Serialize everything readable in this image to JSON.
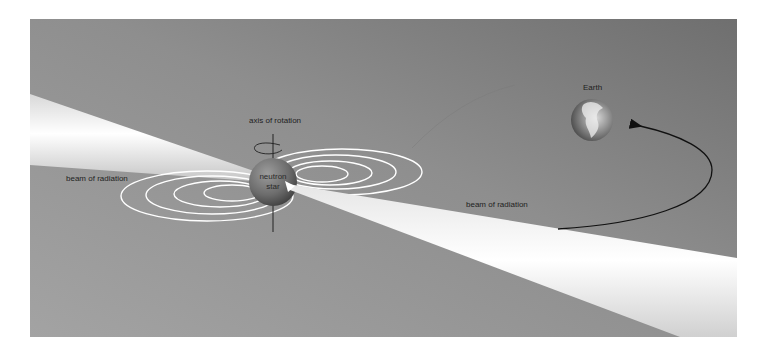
{
  "diagram": {
    "labels": {
      "axis": "axis of rotation",
      "beam_left": "beam of radiation",
      "beam_right": "beam of radiation",
      "star_line1": "neutron",
      "star_line2": "star",
      "earth": "Earth"
    },
    "colors": {
      "background": "#ffffff",
      "panel_light": "#9a9a9a",
      "panel_dark": "#7c7c7c",
      "beam": "#f4f4f4",
      "field_lines": "#ffffff",
      "arrow": "#111111"
    }
  }
}
